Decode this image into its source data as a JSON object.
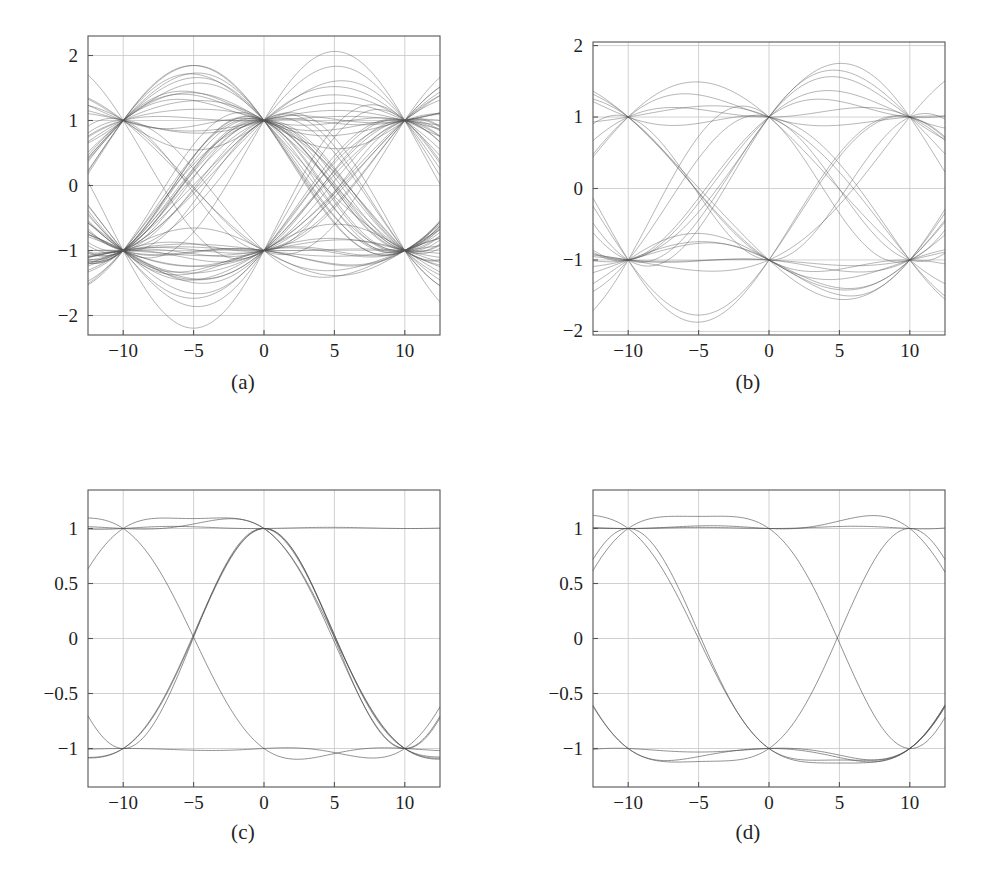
{
  "figure": {
    "title": "",
    "background_color": "#ffffff",
    "trace_color": "#4a4a4a",
    "grid_color": "#c9c9c9",
    "frame_color": "#555555",
    "layout": "2x2 grid of eye-diagram subplots"
  },
  "subplots": [
    {
      "id": "a",
      "caption": "(a)",
      "position": "top-left",
      "chart_data": {
        "type": "line",
        "title": "",
        "xlabel": "",
        "ylabel": "",
        "xlim": [
          -12.5,
          12.5
        ],
        "ylim": [
          -2.3,
          2.3
        ],
        "xticks": [
          -10,
          -5,
          0,
          5,
          10
        ],
        "xticklabels": [
          "-10",
          "-5",
          "0",
          "5",
          "10"
        ],
        "yticks": [
          -2,
          -1,
          0,
          1,
          2
        ],
        "yticklabels": [
          "-2",
          "-1",
          "0",
          "1",
          "2"
        ],
        "grid": true,
        "legend": "none",
        "description": "Eye diagram with strong intersymbol interference; many overlaid traces spanning -2 to +2, pinched nodes at x = -10, 0, +10 at levels +1 and -1, crossings near x = -5 and x = +5.",
        "eye_nodes_x": [
          -10,
          0,
          10
        ],
        "eye_levels": [
          1,
          -1
        ],
        "crossing_x": [
          -5,
          5
        ],
        "peak_overshoot": 1.85,
        "peak_undershoot": -1.85,
        "trace_count": 64
      }
    },
    {
      "id": "b",
      "caption": "(b)",
      "position": "top-right",
      "chart_data": {
        "type": "line",
        "title": "",
        "xlabel": "",
        "ylabel": "",
        "xlim": [
          -12.5,
          12.5
        ],
        "ylim": [
          -2.05,
          2.05
        ],
        "xticks": [
          -10,
          -5,
          0,
          5,
          10
        ],
        "xticklabels": [
          "-10",
          "-5",
          "0",
          "5",
          "10"
        ],
        "yticks": [
          -2,
          -1,
          0,
          1,
          2
        ],
        "yticklabels": [
          "-2",
          "-1",
          "0",
          "1",
          "2"
        ],
        "grid": true,
        "legend": "none",
        "description": "Eye diagram with moderate intersymbol interference; banded trace levels at about 1.7, 1.25, 1.1 and 0.9 (mirrored below zero), pinched nodes at x = -10, 0, +10, crossings near x = -5 and x = +5.",
        "eye_nodes_x": [
          -10,
          0,
          10
        ],
        "eye_levels": [
          1,
          -1
        ],
        "crossing_x": [
          -5,
          5
        ],
        "band_levels": [
          1.7,
          1.25,
          1.1,
          0.9
        ],
        "peak_overshoot": 1.72,
        "peak_undershoot": -1.72,
        "trace_count": 24
      }
    },
    {
      "id": "c",
      "caption": "(c)",
      "position": "bottom-left",
      "chart_data": {
        "type": "line",
        "title": "",
        "xlabel": "",
        "ylabel": "",
        "xlim": [
          -12.5,
          12.5
        ],
        "ylim": [
          -1.35,
          1.35
        ],
        "xticks": [
          -10,
          -5,
          0,
          5,
          10
        ],
        "xticklabels": [
          "-10",
          "-5",
          "0",
          "5",
          "10"
        ],
        "yticks": [
          -1,
          -0.5,
          0,
          0.5,
          1
        ],
        "yticklabels": [
          "-1",
          "-0.5",
          "0",
          "0.5",
          "1"
        ],
        "grid": true,
        "legend": "none",
        "description": "Clean wide-open eye diagram; tight traces with small overshoot to about 1.06, pinched nodes at x = -10, 0, +10 at levels +1 and -1, crossings at x = -5 and x = +5 at level 0.",
        "eye_nodes_x": [
          -10,
          0,
          10
        ],
        "eye_levels": [
          1,
          -1
        ],
        "crossing_x": [
          -5,
          5
        ],
        "peak_overshoot": 1.06,
        "peak_undershoot": -1.06,
        "trace_count": 8
      }
    },
    {
      "id": "d",
      "caption": "(d)",
      "position": "bottom-right",
      "chart_data": {
        "type": "line",
        "title": "",
        "xlabel": "",
        "ylabel": "",
        "xlim": [
          -12.5,
          12.5
        ],
        "ylim": [
          -1.35,
          1.35
        ],
        "xticks": [
          -10,
          -5,
          0,
          5,
          10
        ],
        "xticklabels": [
          "-10",
          "-5",
          "0",
          "5",
          "10"
        ],
        "yticks": [
          -1,
          -0.5,
          0,
          0.5,
          1
        ],
        "yticklabels": [
          "-1",
          "-0.5",
          "0",
          "0.5",
          "1"
        ],
        "grid": true,
        "legend": "none",
        "description": "Clean wide-open eye diagram very similar to (c); tight traces with small ripple near the +1 and -1 rails, pinched nodes at x = -10, 0, +10, crossings at x = -5 and x = +5 at level 0.",
        "eye_nodes_x": [
          -10,
          0,
          10
        ],
        "eye_levels": [
          1,
          -1
        ],
        "crossing_x": [
          -5,
          5
        ],
        "peak_overshoot": 1.06,
        "peak_undershoot": -1.06,
        "trace_count": 8
      }
    }
  ]
}
